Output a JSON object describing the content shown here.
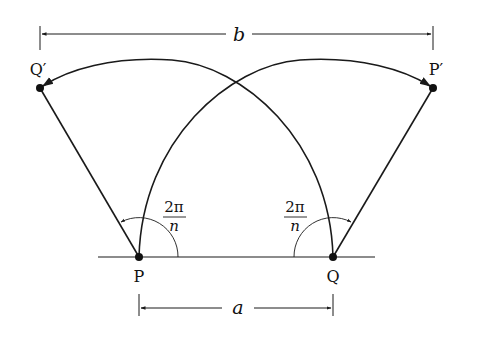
{
  "diagram": {
    "points": {
      "P": {
        "label": "P",
        "x": 139,
        "y": 257
      },
      "Q": {
        "label": "Q",
        "x": 333,
        "y": 257
      },
      "Q_prime": {
        "label": "Q′",
        "x": 40,
        "y": 88
      },
      "P_prime": {
        "label": "P′",
        "x": 433,
        "y": 88
      }
    },
    "dimensions": {
      "top": {
        "label": "b"
      },
      "bottom": {
        "label": "a"
      }
    },
    "angles": {
      "left": {
        "numerator": "2π",
        "denominator": "n"
      },
      "right": {
        "numerator": "2π",
        "denominator": "n"
      }
    },
    "colors": {
      "stroke": "#1a1a1a",
      "background": "#ffffff"
    }
  }
}
